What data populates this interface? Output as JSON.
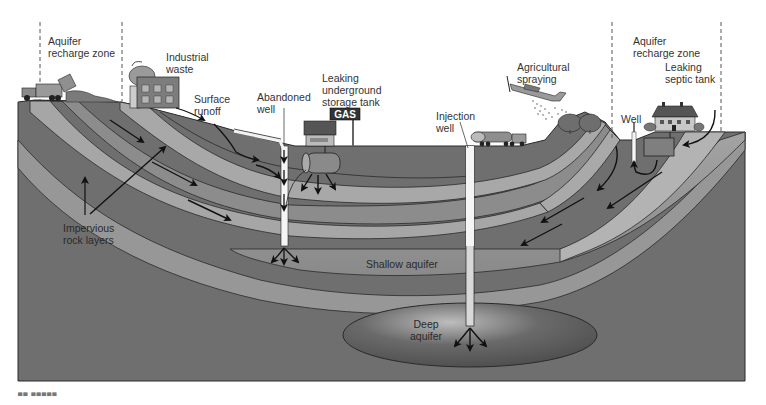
{
  "diagram": {
    "colors": {
      "ground": "#6f6f6f",
      "impervious_layer": "#a9a9a9",
      "shallow_aquifer": "#9c9c9c",
      "deep_aquifer": "#585858",
      "deep_aquifer_glow": "#b0b0b0",
      "outline": "#2a2a2a",
      "sky": "#ffffff",
      "arrow": "#1a1a1a"
    },
    "labels": {
      "aquifer_recharge_left": "Aquifer\nrecharge zone",
      "industrial_waste": "Industrial\nwaste",
      "surface_runoff": "Surface\nrunoff",
      "abandoned_well": "Abandoned\nwell",
      "leaking_tank": "Leaking\nunderground\nstorage tank",
      "gas_sign": "GAS",
      "injection_well": "Injection\nwell",
      "agricultural_spraying": "Agricultural\nspraying",
      "aquifer_recharge_right": "Aquifer\nrecharge zone",
      "leaking_septic_tank": "Leaking\nseptic tank",
      "well": "Well",
      "impervious_rock_layers": "Impervious\nrock layers",
      "shallow_aquifer": "Shallow aquifer",
      "deep_aquifer": "Deep\naquifer"
    },
    "figure_tag": "▀▀ ▀▀▀▀▀"
  }
}
